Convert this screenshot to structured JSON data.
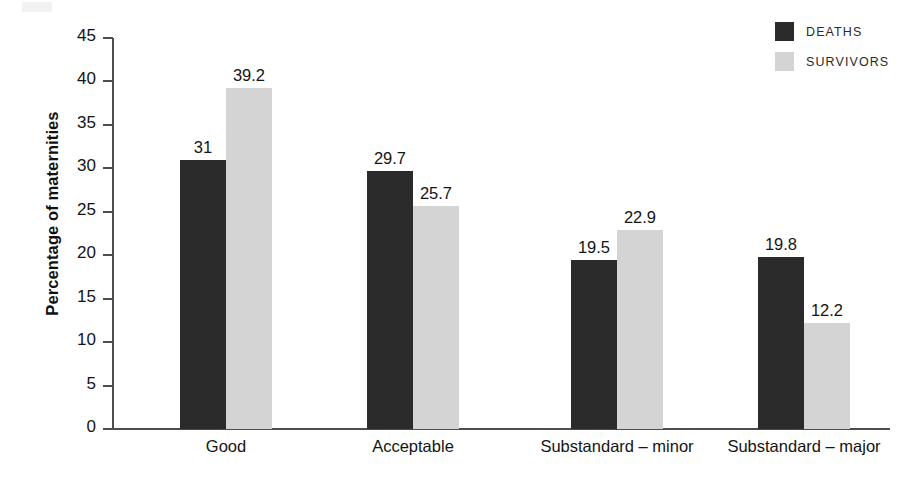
{
  "chart_data": {
    "type": "bar",
    "title": "",
    "subtitle": "",
    "xlabel": "",
    "ylabel": "Percentage of maternities",
    "ylim": [
      0,
      45
    ],
    "ytick_step": 5,
    "yticks": [
      0,
      5,
      10,
      15,
      20,
      25,
      30,
      35,
      40,
      45
    ],
    "ytick_labels": [
      "0",
      "5",
      "10",
      "15",
      "20",
      "25",
      "30",
      "35",
      "40",
      "45"
    ],
    "categories": [
      "Good",
      "Acceptable",
      "Substandard – minor",
      "Substandard – major"
    ],
    "series": [
      {
        "name": "DEATHS",
        "color": "#2b2b2b",
        "values": [
          31,
          29.7,
          19.5,
          19.8
        ],
        "value_labels": [
          "31",
          "29.7",
          "19.5",
          "19.8"
        ]
      },
      {
        "name": "SURVIVORS",
        "color": "#d4d4d4",
        "values": [
          39.2,
          25.7,
          22.9,
          12.2
        ],
        "value_labels": [
          "39.2",
          "25.7",
          "22.9",
          "12.2"
        ]
      }
    ],
    "grid": false,
    "legend_position": "top-right",
    "data_labels": true
  },
  "legend": {
    "entries": [
      {
        "label": "DEATHS",
        "color": "#2b2b2b"
      },
      {
        "label": "SURVIVORS",
        "color": "#d4d4d4"
      }
    ]
  },
  "colors": {
    "deaths": "#2b2b2b",
    "survivors": "#d4d4d4",
    "axis": "#4d4d4d",
    "text": "#141414",
    "background": "#ffffff"
  }
}
